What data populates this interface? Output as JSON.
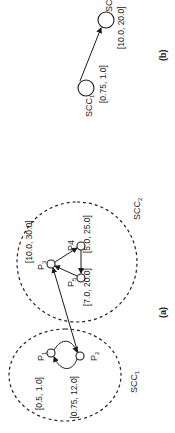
{
  "figure": {
    "panel_a": {
      "caption": "(a)",
      "clusters": [
        {
          "id": "scc1",
          "label": "SCC",
          "sub": "1"
        },
        {
          "id": "scc2",
          "label": "SCC",
          "sub": "2"
        }
      ],
      "nodes": [
        {
          "id": "p1",
          "label": "P",
          "sub": "1",
          "interval": "[0.5, 1.0]"
        },
        {
          "id": "p2",
          "label": "P",
          "sub": "2",
          "interval": "[0.75, 12.0]"
        },
        {
          "id": "p3",
          "label": "P",
          "sub": "3",
          "interval": "[10.0, 30.0]"
        },
        {
          "id": "p4",
          "label": "P4",
          "sub": "",
          "interval": "[5.0, 25.0]"
        },
        {
          "id": "p5",
          "label": "P",
          "sub": "5",
          "interval": "[7.0, 20.0]"
        }
      ],
      "edges": [
        {
          "from": "p1",
          "to": "p2"
        },
        {
          "from": "p2",
          "to": "p1"
        },
        {
          "from": "p2",
          "to": "p3"
        },
        {
          "from": "p3",
          "to": "p4"
        },
        {
          "from": "p4",
          "to": "p5"
        },
        {
          "from": "p5",
          "to": "p3"
        }
      ]
    },
    "panel_b": {
      "caption": "(b)",
      "nodes": [
        {
          "id": "scc1",
          "label": "SCC",
          "sub": "1",
          "interval": "[0.75, 1.0]"
        },
        {
          "id": "scc2",
          "label": "SC",
          "sub": "",
          "interval": "[10.0, 20.0]"
        }
      ],
      "edges": [
        {
          "from": "scc1",
          "to": "scc2"
        }
      ]
    }
  }
}
